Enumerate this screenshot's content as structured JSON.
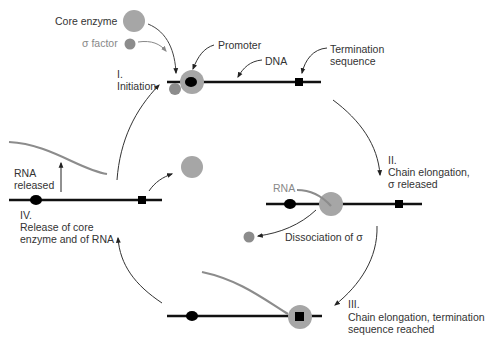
{
  "labels": {
    "core_enzyme": "Core enzyme",
    "sigma_factor": "σ factor",
    "promoter": "Promoter",
    "dna": "DNA",
    "termination_l1": "Termination",
    "termination_l2": "sequence",
    "step1_num": "I.",
    "step1_name": "Initiation",
    "step2_num": "II.",
    "step2_l1": "Chain elongation,",
    "step2_l2": "σ released",
    "rna_bound": "RNA",
    "dissociation": "Dissociation of σ",
    "step3_num": "III.",
    "step3_l1": "Chain elongation, termination",
    "step3_l2": "sequence reached",
    "step4_num": "IV.",
    "step4_l1": "Release of core",
    "step4_l2": "enzyme and of RNA",
    "rna_released_l1": "RNA",
    "rna_released_l2": "released"
  },
  "colors": {
    "dna": "#111111",
    "enzyme": "#a6a6a6",
    "sigma": "#8c8c8c",
    "rna": "#8c8c8c",
    "arrow": "#333333"
  }
}
